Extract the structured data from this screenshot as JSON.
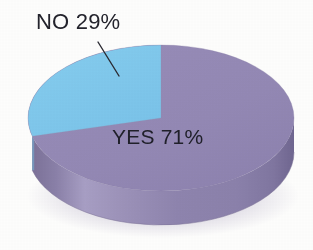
{
  "chart_data": {
    "type": "pie",
    "title": "",
    "subtitle": "",
    "xlabel": "",
    "ylabel": "",
    "grid": false,
    "legend_position": "none",
    "style": "3d-cylinder",
    "categories": [
      "YES",
      "NO"
    ],
    "values": [
      71,
      29
    ],
    "unit": "%",
    "slices": [
      {
        "label": "YES",
        "value": 71,
        "display": "YES 71%",
        "color": "#9287b4",
        "side_color": "#8a7fae",
        "label_placement": "inside",
        "start_angle_deg": 0,
        "end_angle_deg": 255.6
      },
      {
        "label": "NO",
        "value": 29,
        "display": "NO 29%",
        "color": "#7fc8ec",
        "side_color": "#6fb4d9",
        "label_placement": "outside-leader",
        "start_angle_deg": 255.6,
        "end_angle_deg": 360
      }
    ],
    "annotations": [
      {
        "name": "no-leader-line",
        "from_x": 98,
        "from_y": 42,
        "to_x": 119,
        "to_y": 76,
        "color": "#2b2b33"
      }
    ],
    "background_color": "#fdfdfc",
    "text_color": "#20202a"
  },
  "labels": {
    "no_label": "NO 29%",
    "yes_label": "YES 71%"
  },
  "colors": {
    "blue_top": "#7fc8ec",
    "blue_side": "#6fb4d9",
    "purple_top": "#9287b4",
    "purple_side": "#8a7fae",
    "purple_side_light": "#a79ec4",
    "purple_side_dark": "#7b7099",
    "text": "#20202a",
    "background": "#fdfdfc"
  }
}
